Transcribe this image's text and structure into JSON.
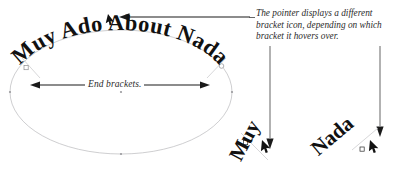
{
  "figure": {
    "curved_headline": "Muy Ado About Nada",
    "end_brackets_label": "End brackets.",
    "callout": {
      "line1": "The pointer displays a different",
      "line2": "bracket icon, depending on which",
      "line3": "bracket it hovers over."
    },
    "insets": [
      {
        "word": "Muy",
        "icon": "start-bracket-cursor-icon"
      },
      {
        "word": "Nada",
        "icon": "end-bracket-cursor-icon"
      }
    ],
    "colors": {
      "background": "#ffffff",
      "text": "#111111",
      "path_stroke": "#b9b9bb",
      "arrow_stroke": "#1a1a1a",
      "leader_stroke": "#4a4a4a",
      "node_stroke": "#8e8e92"
    }
  }
}
